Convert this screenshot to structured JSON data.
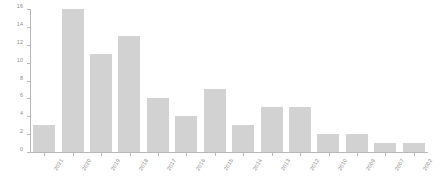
{
  "chart_data": {
    "type": "bar",
    "title": "",
    "subtitle": "",
    "xlabel": "",
    "ylabel": "",
    "categories": [
      "2021",
      "2020",
      "2019",
      "2018",
      "2017",
      "2016",
      "2015",
      "2014",
      "2013",
      "2012",
      "2010",
      "2009",
      "2007",
      "2002"
    ],
    "values": [
      3,
      16,
      11,
      13,
      6,
      4,
      7,
      3,
      5,
      5,
      2,
      2,
      1,
      1
    ],
    "ylim": [
      0,
      16
    ],
    "yticks": [
      "0",
      "2",
      "4",
      "6",
      "8",
      "10",
      "12",
      "14",
      "16"
    ],
    "ytick_values": [
      0,
      2,
      4,
      6,
      8,
      10,
      12,
      14,
      16
    ],
    "grid": false,
    "legend": null,
    "legend_position": "none",
    "bar_color": "#d2d2d2",
    "axis_color": "#b8b8b8",
    "tick_label_color": "#8a8a8a"
  }
}
